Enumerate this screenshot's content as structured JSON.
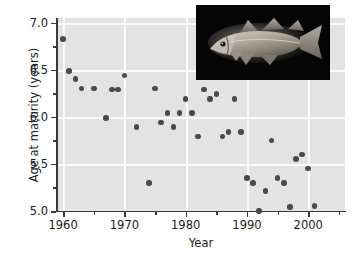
{
  "chart_data": {
    "type": "scatter",
    "title": "",
    "xlabel": "Year",
    "ylabel": "Age at maturity (years)",
    "xlim": [
      1959,
      2006
    ],
    "ylim": [
      5.0,
      7.05
    ],
    "xticks": [
      1960,
      1970,
      1980,
      1990,
      2000
    ],
    "xtick_labels": [
      "1960",
      "1970",
      "1980",
      "1990",
      "2000"
    ],
    "yticks": [
      5.0,
      5.5,
      6.0,
      6.5,
      7.0
    ],
    "ytick_labels": [
      "5.0",
      "5.5",
      "6.0",
      "6.5",
      "7.0"
    ],
    "yticks_minor": [
      5.25,
      5.75,
      6.25,
      6.75
    ],
    "grid": "white gridlines at major ticks",
    "legend": "none",
    "marker_color": "#4a4a4a",
    "panel_color": "#e3e3e3",
    "series": [
      {
        "name": "Age at maturity",
        "points": [
          {
            "x": 1960,
            "y": 6.83
          },
          {
            "x": 1961,
            "y": 6.49
          },
          {
            "x": 1962,
            "y": 6.4
          },
          {
            "x": 1963,
            "y": 6.3
          },
          {
            "x": 1965,
            "y": 6.3
          },
          {
            "x": 1967,
            "y": 5.99
          },
          {
            "x": 1968,
            "y": 6.29
          },
          {
            "x": 1969,
            "y": 6.29
          },
          {
            "x": 1970,
            "y": 6.44
          },
          {
            "x": 1972,
            "y": 5.89
          },
          {
            "x": 1974,
            "y": 5.3
          },
          {
            "x": 1975,
            "y": 6.3
          },
          {
            "x": 1976,
            "y": 5.94
          },
          {
            "x": 1977,
            "y": 6.04
          },
          {
            "x": 1978,
            "y": 5.89
          },
          {
            "x": 1979,
            "y": 6.04
          },
          {
            "x": 1980,
            "y": 6.19
          },
          {
            "x": 1981,
            "y": 6.04
          },
          {
            "x": 1982,
            "y": 5.79
          },
          {
            "x": 1983,
            "y": 6.29
          },
          {
            "x": 1984,
            "y": 6.19
          },
          {
            "x": 1985,
            "y": 6.24
          },
          {
            "x": 1986,
            "y": 5.79
          },
          {
            "x": 1987,
            "y": 5.84
          },
          {
            "x": 1988,
            "y": 6.19
          },
          {
            "x": 1989,
            "y": 5.84
          },
          {
            "x": 1990,
            "y": 5.35
          },
          {
            "x": 1991,
            "y": 5.3
          },
          {
            "x": 1992,
            "y": 5.0
          },
          {
            "x": 1993,
            "y": 5.21
          },
          {
            "x": 1994,
            "y": 5.75
          },
          {
            "x": 1995,
            "y": 5.35
          },
          {
            "x": 1996,
            "y": 5.3
          },
          {
            "x": 1997,
            "y": 5.04
          },
          {
            "x": 1998,
            "y": 5.55
          },
          {
            "x": 1999,
            "y": 5.6
          },
          {
            "x": 2000,
            "y": 5.45
          },
          {
            "x": 2001,
            "y": 5.05
          }
        ]
      }
    ]
  },
  "inset": {
    "name": "cod-photograph",
    "description": "Photograph of an Atlantic cod on black background",
    "background_color": "#050505"
  }
}
